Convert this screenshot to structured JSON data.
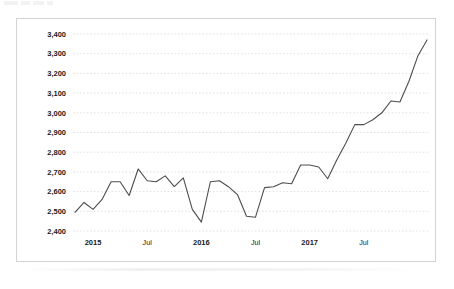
{
  "chart_data": {
    "type": "line",
    "title": "",
    "subtitle": "",
    "xlabel": "",
    "ylabel": "",
    "ylim": [
      2400,
      3400
    ],
    "y_ticks": [
      "2,400",
      "2,500",
      "2,600",
      "2,700",
      "2,800",
      "2,900",
      "3,000",
      "3,100",
      "3,200",
      "3,300",
      "3,400"
    ],
    "y_tick_values": [
      2400,
      2500,
      2600,
      2700,
      2800,
      2900,
      3000,
      3100,
      3200,
      3300,
      3400
    ],
    "x_ticks": [
      "2015",
      "Jul",
      "2016",
      "Jul",
      "2017",
      "Jul"
    ],
    "x_tick_values": [
      2,
      8,
      14,
      20,
      26,
      32
    ],
    "grid": "horizontal-dotted",
    "legend": "none",
    "line_color": "#4d4d4d",
    "grid_color": "#d9d9d9",
    "border_color": "#d4d4d4",
    "series": [
      {
        "name": "series-1",
        "x": [
          0,
          1,
          2,
          3,
          4,
          5,
          6,
          7,
          8,
          9,
          10,
          11,
          12,
          13,
          14,
          15,
          16,
          17,
          18,
          19,
          20,
          21,
          22,
          23,
          24,
          25,
          26,
          27,
          28,
          29,
          30,
          31,
          32,
          33,
          34,
          35,
          36,
          37,
          38,
          39
        ],
        "values": [
          2495,
          2545,
          2510,
          2560,
          2650,
          2650,
          2580,
          2715,
          2655,
          2650,
          2680,
          2625,
          2670,
          2510,
          2445,
          2650,
          2655,
          2625,
          2585,
          2475,
          2470,
          2620,
          2625,
          2645,
          2640,
          2735,
          2735,
          2725,
          2665,
          2760,
          2845,
          2940,
          2940,
          2965,
          3000,
          3060,
          3055,
          3160,
          3290,
          3370
        ]
      }
    ]
  },
  "top_artifact": {
    "bars": [
      14,
      9,
      11,
      6
    ]
  }
}
